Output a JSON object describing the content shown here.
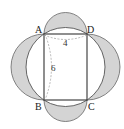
{
  "diagram": {
    "type": "geometry",
    "vertices": {
      "A": "A",
      "B": "B",
      "C": "C",
      "D": "D"
    },
    "dimensions": {
      "AD": "4",
      "AB": "6"
    },
    "colors": {
      "shade": "#d4d4d4",
      "stroke": "#555555",
      "dashed": "#999999"
    }
  }
}
